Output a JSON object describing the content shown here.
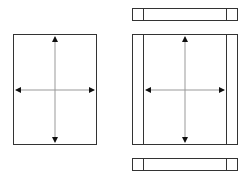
{
  "diagram": {
    "colors": {
      "stroke": "#333333",
      "arrow": "#999999",
      "arrowhead": "#111111",
      "background": "#ffffff"
    },
    "left_panel": {
      "x": 13,
      "y": 34,
      "w": 84,
      "h": 111
    },
    "right_panel": {
      "top_bar": {
        "x": 132,
        "y": 8,
        "w": 106,
        "h": 12,
        "dividers": [
          143,
          226
        ]
      },
      "main": {
        "x": 132,
        "y": 34,
        "w": 106,
        "h": 111,
        "dividers": [
          143,
          226
        ]
      },
      "bottom_bar": {
        "x": 132,
        "y": 158,
        "w": 106,
        "h": 13,
        "dividers": [
          143,
          226
        ]
      }
    }
  }
}
